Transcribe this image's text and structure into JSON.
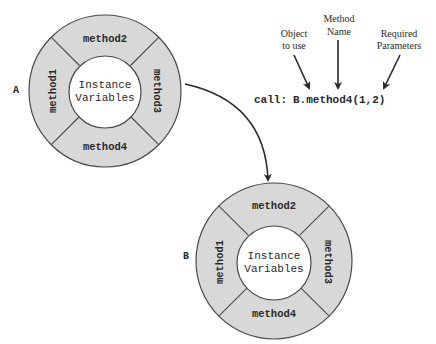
{
  "diagram": {
    "objects": [
      {
        "label": "A",
        "center_text_line1": "Instance",
        "center_text_line2": "Variables",
        "methods": [
          "method1",
          "method2",
          "method3",
          "method4"
        ]
      },
      {
        "label": "B",
        "center_text_line1": "Instance",
        "center_text_line2": "Variables",
        "methods": [
          "method1",
          "method2",
          "method3",
          "method4"
        ]
      }
    ],
    "call": {
      "prefix": "call:",
      "expression": "B.method4(1,2)"
    },
    "annotations": {
      "object_line1": "Object",
      "object_line2": "to use",
      "method_line1": "Method",
      "method_line2": "Name",
      "params_line1": "Required",
      "params_line2": "Parameters"
    },
    "colors": {
      "ring_fill": "#d8d8d8",
      "stroke": "#4a4a4a",
      "core_fill": "#ffffff",
      "text": "#2a2a2a"
    }
  }
}
